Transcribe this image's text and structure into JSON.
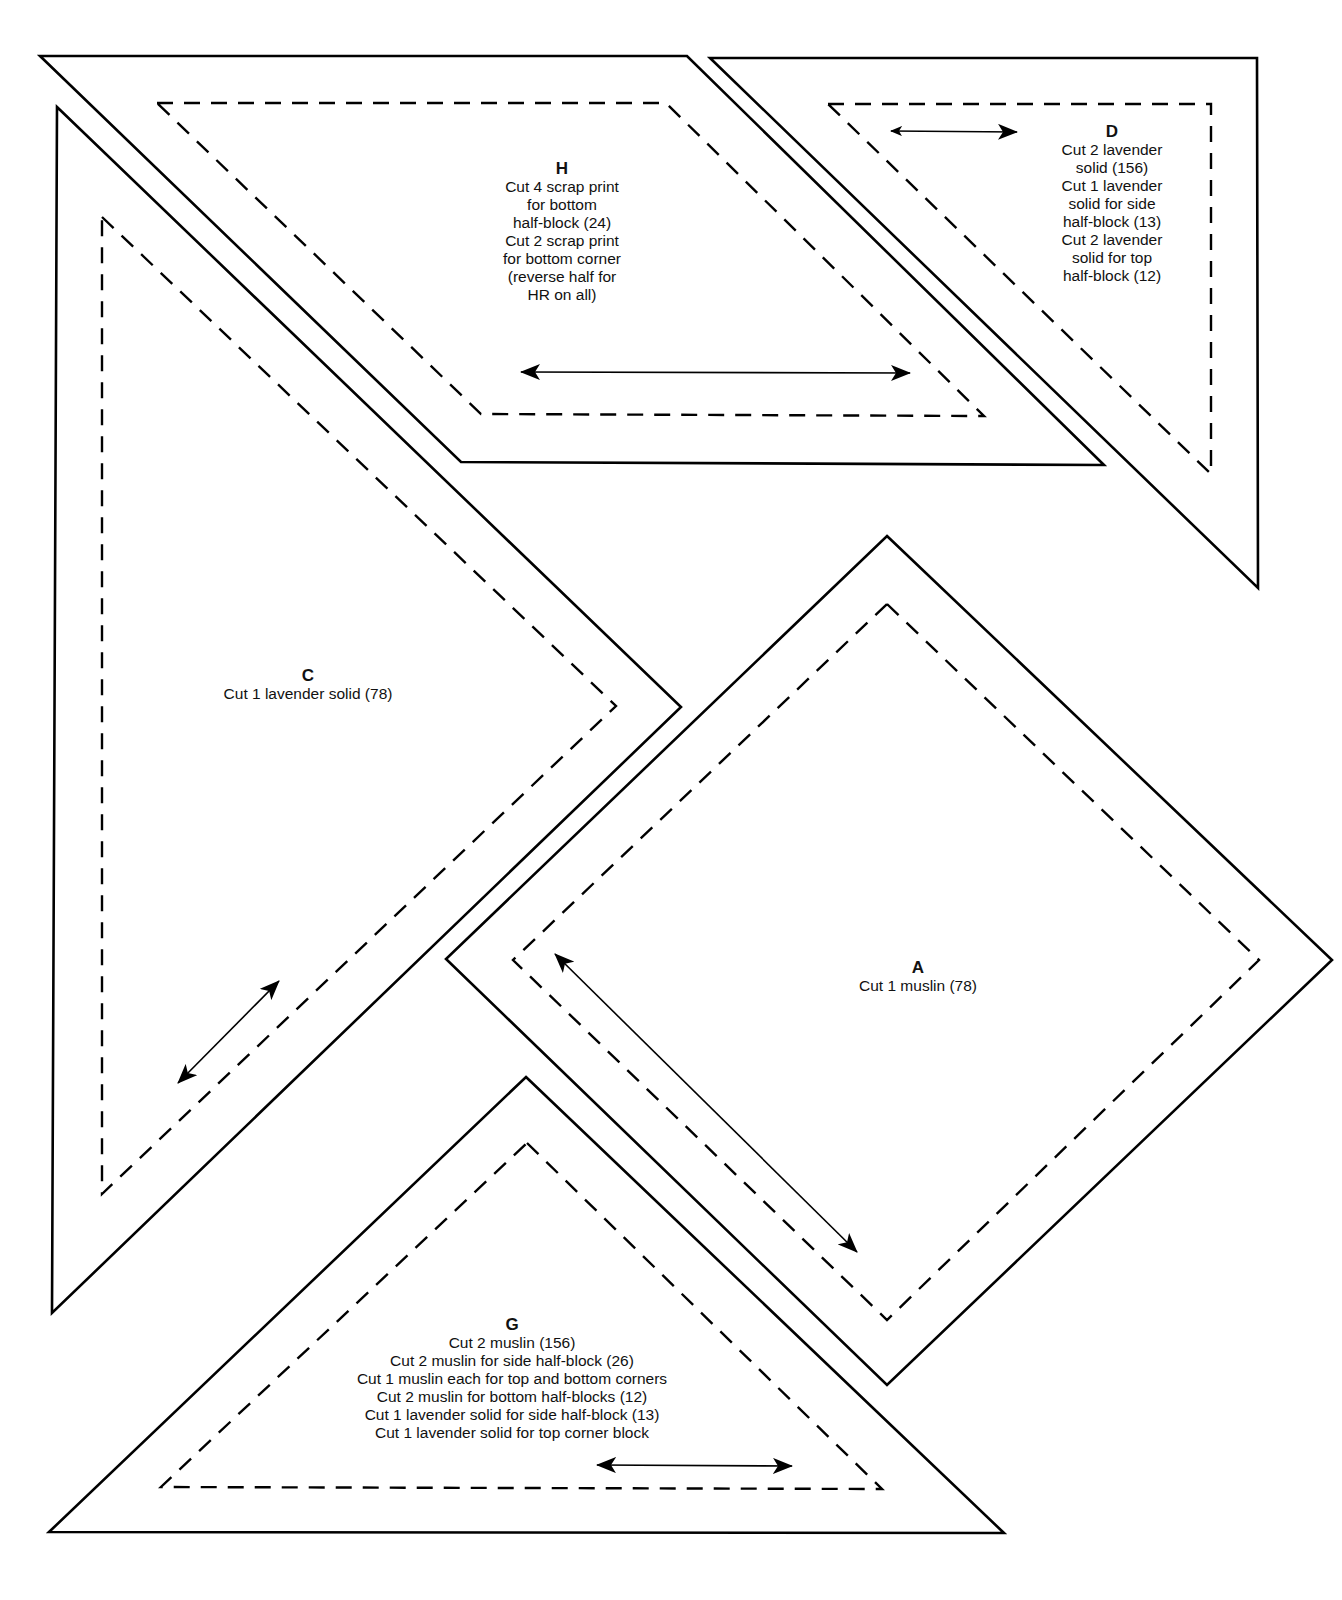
{
  "diagram": {
    "type": "quilt pattern templates",
    "line_legend": {
      "solid": "cutting line",
      "dashed": "seam line",
      "double_arrow": "grain line"
    },
    "colors": {
      "line": "#000000",
      "background": "#ffffff",
      "text": "#111111"
    }
  },
  "pieces": {
    "H": {
      "letter": "H",
      "lines": [
        "Cut 4 scrap print",
        "for bottom",
        "half-block (24)",
        "Cut 2 scrap print",
        "for bottom corner",
        "(reverse half for",
        "HR on all)"
      ]
    },
    "D": {
      "letter": "D",
      "lines": [
        "Cut 2 lavender",
        "solid (156)",
        "Cut 1 lavender",
        "solid for side",
        "half-block (13)",
        "Cut 2 lavender",
        "solid for top",
        "half-block (12)"
      ]
    },
    "C": {
      "letter": "C",
      "lines": [
        "Cut 1 lavender solid (78)"
      ]
    },
    "A": {
      "letter": "A",
      "lines": [
        "Cut 1 muslin (78)"
      ]
    },
    "G": {
      "letter": "G",
      "lines": [
        "Cut 2 muslin (156)",
        "Cut 2 muslin for side half-block (26)",
        "Cut 1 muslin each for top and bottom corners",
        "Cut 2 muslin for bottom half-blocks (12)",
        "Cut 1 lavender solid for side half-block (13)",
        "Cut 1 lavender solid for top corner block"
      ]
    }
  }
}
